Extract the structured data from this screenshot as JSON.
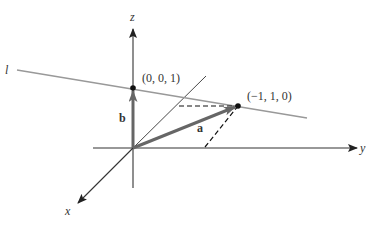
{
  "diagram": {
    "axes": {
      "x_label": "x",
      "y_label": "y",
      "z_label": "z"
    },
    "line": {
      "label": "l"
    },
    "points": [
      {
        "label": "(0, 0, 1)",
        "coords": [
          0,
          0,
          1
        ]
      },
      {
        "label": "(−1, 1, 0)",
        "coords": [
          -1,
          1,
          0
        ]
      }
    ],
    "vectors": [
      {
        "label": "a",
        "from": [
          0,
          0,
          0
        ],
        "to": [
          -1,
          1,
          0
        ]
      },
      {
        "label": "b",
        "from": [
          0,
          0,
          0
        ],
        "to": [
          0,
          0,
          1
        ]
      }
    ],
    "colors": {
      "axis": "#333333",
      "line": "#999999",
      "vector": "#666666",
      "dashed": "#111111"
    }
  }
}
